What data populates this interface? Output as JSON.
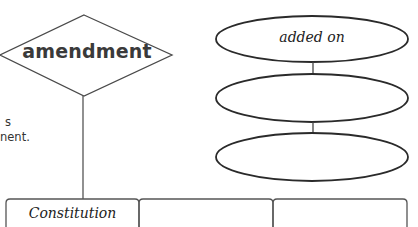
{
  "diagram": {
    "relationship": {
      "label": "amendment",
      "shape": "diamond"
    },
    "attributes": [
      {
        "label": "added on",
        "shape": "ellipse"
      },
      {
        "label": "",
        "shape": "ellipse"
      },
      {
        "label": "",
        "shape": "ellipse"
      }
    ],
    "side_text": {
      "line1": "s",
      "line2": "nent."
    },
    "boxes": [
      {
        "label": "Constitution"
      },
      {
        "label": ""
      },
      {
        "label": ""
      }
    ],
    "colors": {
      "stroke": "#3a3a3a",
      "background": "#ffffff",
      "text": "#333333"
    }
  }
}
